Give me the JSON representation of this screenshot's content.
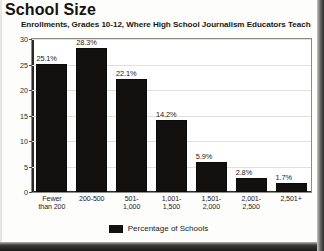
{
  "header": {
    "title": "School Size",
    "subtitle": "Enrollments, Grades 10-12, Where High School Journalism Educators Teach"
  },
  "legend": {
    "label": "Percentage of Schools",
    "swatch_color": "#121110"
  },
  "chart_data": {
    "type": "bar",
    "title": "School Size",
    "subtitle": "Enrollments, Grades 10-12, Where High School Journalism Educators Teach",
    "xlabel": "",
    "ylabel": "",
    "ylim": [
      0,
      30
    ],
    "yticks": [
      0,
      5,
      10,
      15,
      20,
      25,
      30
    ],
    "ytick_labels": [
      "0",
      "5",
      "10",
      "15",
      "20",
      "25",
      "30"
    ],
    "grid": true,
    "legend_position": "bottom-center",
    "series_name": "Percentage of Schools",
    "bar_color": "#121110",
    "categories": [
      "Fewer\nthan 200",
      "200-500",
      "501-\n1,000",
      "1,001-\n1,500",
      "1,501-\n2,000",
      "2,001-\n2,500",
      "2,501+"
    ],
    "values": [
      25.1,
      28.3,
      22.1,
      14.2,
      5.9,
      2.8,
      1.7
    ],
    "value_labels": [
      "25.1%",
      "28.3%",
      "22.1%",
      "14.2%",
      "5.9%",
      "2.8%",
      "1.7%"
    ]
  }
}
